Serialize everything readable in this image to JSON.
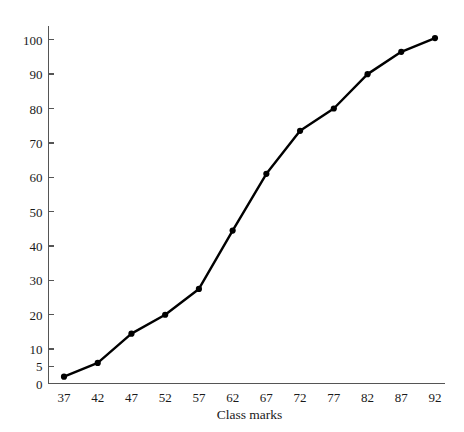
{
  "chart_data": {
    "type": "line",
    "title": "",
    "xlabel": "Class marks",
    "ylabel": "",
    "categories": [
      37,
      42,
      47,
      52,
      57,
      62,
      67,
      72,
      77,
      82,
      87,
      92
    ],
    "x": [
      37,
      42,
      47,
      52,
      57,
      62,
      67,
      72,
      77,
      82,
      87,
      92
    ],
    "values": [
      2,
      6,
      14.5,
      20,
      27.5,
      44.5,
      61,
      73.5,
      80,
      90,
      96.5,
      100.5
    ],
    "series": [
      {
        "name": "Cumulative frequency",
        "values": [
          2,
          6,
          14.5,
          20,
          27.5,
          44.5,
          61,
          73.5,
          80,
          90,
          96.5,
          100.5
        ]
      }
    ],
    "xlim": [
      34.5,
      94.5
    ],
    "ylim": [
      0,
      104
    ],
    "xticks": [
      37,
      42,
      47,
      52,
      57,
      62,
      67,
      72,
      77,
      82,
      87,
      92
    ],
    "xtick_labels": [
      "37",
      "42",
      "47",
      "52",
      "57",
      "62",
      "67",
      "72",
      "77",
      "82",
      "87",
      "92"
    ],
    "yticks": [
      0,
      5,
      10,
      20,
      30,
      40,
      50,
      60,
      70,
      80,
      90,
      100
    ],
    "ytick_labels": [
      "0",
      "5",
      "10",
      "20",
      "30",
      "40",
      "50",
      "60",
      "70",
      "80",
      "90",
      "100"
    ],
    "grid": false,
    "legend": false,
    "legend_position": "none",
    "line_color": "#000000",
    "marker": "circle",
    "marker_color": "#000000",
    "axis_color": "#555555",
    "background_color": "#ffffff"
  }
}
